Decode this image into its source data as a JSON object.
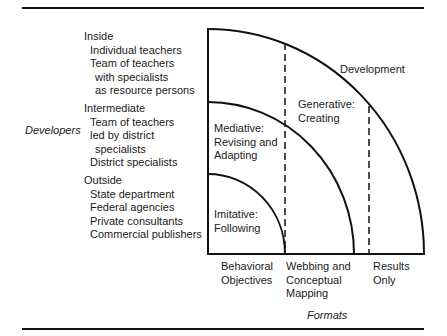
{
  "figure": {
    "y_axis_title": "Developers",
    "x_axis_title": "Formats",
    "developer_groups": [
      {
        "heading": "Inside",
        "items": [
          {
            "text": "Individual teachers",
            "indent": 1
          },
          {
            "text": "Team of teachers",
            "indent": 1
          },
          {
            "text": "with specialists",
            "indent": 2
          },
          {
            "text": "as resource persons",
            "indent": 2
          }
        ]
      },
      {
        "heading": "Intermediate",
        "items": [
          {
            "text": "Team of teachers",
            "indent": 1
          },
          {
            "text": "led by district",
            "indent": 1
          },
          {
            "text": "specialists",
            "indent": 2
          },
          {
            "text": "District specialists",
            "indent": 1
          }
        ]
      },
      {
        "heading": "Outside",
        "items": [
          {
            "text": "State department",
            "indent": 1
          },
          {
            "text": "Federal agencies",
            "indent": 1
          },
          {
            "text": "Private consultants",
            "indent": 1
          },
          {
            "text": "Commercial publishers",
            "indent": 1
          }
        ]
      }
    ],
    "regions": [
      {
        "line1": "Imitative:",
        "line2": "Following"
      },
      {
        "line1": "Mediative:",
        "line2": "Revising and",
        "line3": "Adapting"
      },
      {
        "line1": "Generative:",
        "line2": "Creating"
      },
      {
        "line1": "Development"
      }
    ],
    "formats": [
      {
        "line1": "Behavioral",
        "line2": "Objectives"
      },
      {
        "line1": "Webbing and",
        "line2": "Conceptual",
        "line3": "Mapping"
      },
      {
        "line1": "Results",
        "line2": "Only"
      }
    ]
  }
}
